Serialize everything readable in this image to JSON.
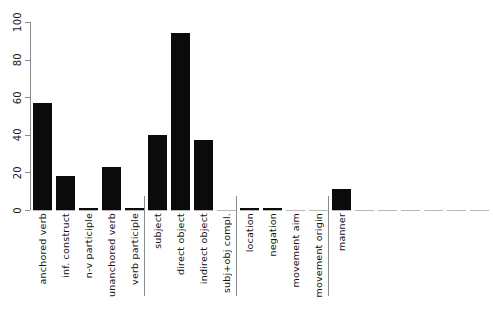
{
  "chart_data": {
    "type": "bar",
    "title": "",
    "subtitle": "",
    "xlabel": "",
    "ylabel": "",
    "ylim": [
      0,
      100
    ],
    "yticks": [
      0,
      20,
      40,
      60,
      80,
      100
    ],
    "ytick_labels": [
      "0",
      "20",
      "40",
      "60",
      "80",
      "100"
    ],
    "grid": false,
    "legend": null,
    "bar_color": "#0b0b0b",
    "axis_color": "#8a8a8a",
    "baseline_color": "#b9b9b9",
    "orientation": "vertical",
    "categories": [
      "anchored verb",
      "inf. construct",
      "n-v participle",
      "unanchored verb",
      "verb participle",
      "subject",
      "direct object",
      "indirect object",
      "subj+obj compl.",
      "location",
      "negation",
      "movement aim",
      "movement origin",
      "manner",
      "",
      "",
      "",
      "",
      "",
      ""
    ],
    "values": [
      57,
      18,
      1,
      23,
      1,
      40,
      94,
      37,
      0,
      1,
      1,
      0,
      0,
      11,
      0,
      0,
      0,
      0,
      0,
      0
    ],
    "groups": [
      {
        "name": "verb forms",
        "start_index": 0,
        "end_index": 4
      },
      {
        "name": "arguments",
        "start_index": 5,
        "end_index": 8
      },
      {
        "name": "adjuncts",
        "start_index": 9,
        "end_index": 12
      },
      {
        "name": "other",
        "start_index": 13,
        "end_index": 19
      }
    ]
  }
}
